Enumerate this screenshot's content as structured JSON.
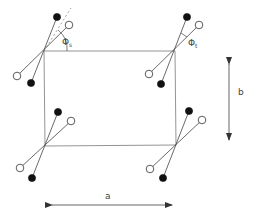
{
  "diagram": {
    "labels": {
      "phi_s": "Φ",
      "phi_s_sub": "s",
      "phi_t": "Φ",
      "phi_t_sub": "t",
      "a": "a",
      "b": "b"
    },
    "colors": {
      "line": "#555555",
      "filled_atom": "#111111",
      "open_atom": "#ffffff"
    }
  }
}
